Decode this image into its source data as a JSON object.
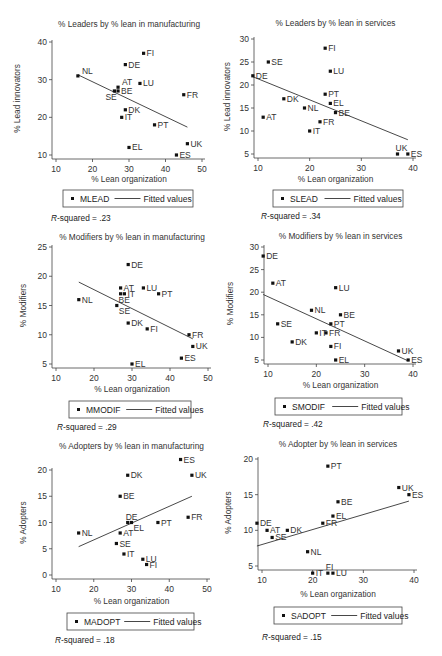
{
  "chart_data": [
    {
      "id": "mlead",
      "type": "scatter",
      "title": "% Leaders by % lean in manufacturing",
      "xlabel": "% Lean organization",
      "ylabel": "% Lead innovators",
      "xlim": [
        10,
        50
      ],
      "ylim": [
        10,
        40
      ],
      "xticks": [
        10,
        20,
        30,
        40,
        50
      ],
      "yticks": [
        10,
        20,
        30,
        40
      ],
      "grid": false,
      "legend": {
        "series": "MLEAD",
        "fit": "Fitted values",
        "position": "bottom"
      },
      "r_squared": ".23",
      "fit_line": [
        [
          16,
          31.3
        ],
        [
          46,
          17.4
        ]
      ],
      "points": [
        {
          "label": "FI",
          "x": 34,
          "y": 37,
          "pos": "r"
        },
        {
          "label": "DE",
          "x": 29,
          "y": 34,
          "pos": "r"
        },
        {
          "label": "NL",
          "x": 16,
          "y": 31,
          "pos": "tr"
        },
        {
          "label": "LU",
          "x": 33,
          "y": 29,
          "pos": "r"
        },
        {
          "label": "AT",
          "x": 27,
          "y": 28,
          "pos": "tr"
        },
        {
          "label": "BE",
          "x": 27,
          "y": 27,
          "pos": "r"
        },
        {
          "label": "SE",
          "x": 26,
          "y": 27,
          "pos": "bl"
        },
        {
          "label": "FR",
          "x": 45,
          "y": 26,
          "pos": "r"
        },
        {
          "label": "DK",
          "x": 29,
          "y": 22,
          "pos": "r"
        },
        {
          "label": "IT",
          "x": 28,
          "y": 20,
          "pos": "r"
        },
        {
          "label": "PT",
          "x": 37,
          "y": 18,
          "pos": "r"
        },
        {
          "label": "UK",
          "x": 46,
          "y": 13,
          "pos": "r"
        },
        {
          "label": "EL",
          "x": 30,
          "y": 12,
          "pos": "r"
        },
        {
          "label": "ES",
          "x": 43,
          "y": 10,
          "pos": "r"
        }
      ],
      "frame": {
        "x0": 56,
        "x1": 202,
        "y0": 155,
        "y1": 42,
        "titleY": 27,
        "legendY": 190,
        "legendX": 63,
        "legendW": 130,
        "rsqY": 221,
        "ylabX": 20,
        "xlabY": 182
      }
    },
    {
      "id": "slead",
      "type": "scatter",
      "title": "% Leaders by % lean in services",
      "xlabel": "% Lean organization",
      "ylabel": "% Lead innovators",
      "xlim": [
        10,
        40
      ],
      "ylim": [
        5,
        30
      ],
      "xticks": [
        10,
        20,
        30,
        40
      ],
      "yticks": [
        5,
        10,
        15,
        20,
        25,
        30
      ],
      "grid": false,
      "legend": {
        "series": "SLEAD",
        "fit": "Fitted values",
        "position": "bottom"
      },
      "r_squared": ".34",
      "fit_line": [
        [
          9,
          21.8
        ],
        [
          39,
          8.1
        ]
      ],
      "points": [
        {
          "label": "FI",
          "x": 23,
          "y": 28,
          "pos": "r"
        },
        {
          "label": "SE",
          "x": 12,
          "y": 25,
          "pos": "r"
        },
        {
          "label": "LU",
          "x": 24,
          "y": 23,
          "pos": "r"
        },
        {
          "label": "DE",
          "x": 9,
          "y": 22,
          "pos": "r"
        },
        {
          "label": "PT",
          "x": 23,
          "y": 18,
          "pos": "r"
        },
        {
          "label": "DK",
          "x": 15,
          "y": 17,
          "pos": "r"
        },
        {
          "label": "EL",
          "x": 24,
          "y": 16,
          "pos": "r"
        },
        {
          "label": "NL",
          "x": 19,
          "y": 15,
          "pos": "r"
        },
        {
          "label": "BE",
          "x": 25,
          "y": 14,
          "pos": "r"
        },
        {
          "label": "AT",
          "x": 11,
          "y": 13,
          "pos": "r"
        },
        {
          "label": "FR",
          "x": 22,
          "y": 12,
          "pos": "r"
        },
        {
          "label": "IT",
          "x": 20,
          "y": 10,
          "pos": "r"
        },
        {
          "label": "UK",
          "x": 37,
          "y": 5,
          "pos": "t"
        },
        {
          "label": "ES",
          "x": 39,
          "y": 5,
          "pos": "r"
        }
      ],
      "frame": {
        "x0": 258,
        "x1": 413,
        "y0": 154,
        "y1": 39,
        "titleY": 26,
        "legendY": 190,
        "legendX": 273,
        "legendW": 130,
        "rsqY": 219,
        "ylabX": 230,
        "xlabY": 182
      }
    },
    {
      "id": "mmodif",
      "type": "scatter",
      "title": "% Modifiers by % lean in manufacturing",
      "xlabel": "% Lean organization",
      "ylabel": "% Modifiers",
      "xlim": [
        10,
        50
      ],
      "ylim": [
        5,
        25
      ],
      "xticks": [
        10,
        20,
        30,
        40,
        50
      ],
      "yticks": [
        5,
        10,
        15,
        20,
        25
      ],
      "grid": false,
      "legend": {
        "series": "MMODIF",
        "fit": "Fitted values",
        "position": "bottom"
      },
      "r_squared": ".29",
      "fit_line": [
        [
          16,
          19
        ],
        [
          46,
          9.3
        ]
      ],
      "points": [
        {
          "label": "DE",
          "x": 29,
          "y": 22,
          "pos": "r"
        },
        {
          "label": "AT",
          "x": 27,
          "y": 18,
          "pos": "r"
        },
        {
          "label": "LU",
          "x": 33,
          "y": 18,
          "pos": "r"
        },
        {
          "label": "IT",
          "x": 28,
          "y": 17,
          "pos": "r"
        },
        {
          "label": "PT",
          "x": 37,
          "y": 17,
          "pos": "r"
        },
        {
          "label": "BE",
          "x": 27,
          "y": 17,
          "pos": "b"
        },
        {
          "label": "NL",
          "x": 16,
          "y": 16,
          "pos": "r"
        },
        {
          "label": "SE",
          "x": 26,
          "y": 15,
          "pos": "br"
        },
        {
          "label": "DK",
          "x": 29,
          "y": 12,
          "pos": "r"
        },
        {
          "label": "FI",
          "x": 34,
          "y": 11,
          "pos": "r"
        },
        {
          "label": "FR",
          "x": 45,
          "y": 10,
          "pos": "r"
        },
        {
          "label": "UK",
          "x": 46,
          "y": 8,
          "pos": "r"
        },
        {
          "label": "ES",
          "x": 43,
          "y": 6,
          "pos": "r"
        },
        {
          "label": "EL",
          "x": 30,
          "y": 5,
          "pos": "r"
        }
      ],
      "frame": {
        "x0": 56,
        "x1": 208,
        "y0": 364,
        "y1": 247,
        "titleY": 240,
        "legendY": 401,
        "legendX": 69,
        "legendW": 122,
        "rsqY": 430,
        "ylabX": 26,
        "xlabY": 392
      }
    },
    {
      "id": "smodif",
      "type": "scatter",
      "title": "% Modifiers by % lean in services",
      "xlabel": "% Lean organization",
      "ylabel": "% Modifiers",
      "xlim": [
        10,
        40
      ],
      "ylim": [
        5,
        30
      ],
      "xticks": [
        10,
        20,
        30,
        40
      ],
      "yticks": [
        5,
        10,
        15,
        20,
        25,
        30
      ],
      "grid": false,
      "legend": {
        "series": "SMODIF",
        "fit": "Fitted values",
        "position": "bottom"
      },
      "r_squared": ".42",
      "fit_line": [
        [
          9,
          19.5
        ],
        [
          39,
          4.8
        ]
      ],
      "points": [
        {
          "label": "DE",
          "x": 9,
          "y": 28,
          "pos": "r"
        },
        {
          "label": "AT",
          "x": 11,
          "y": 22,
          "pos": "r"
        },
        {
          "label": "LU",
          "x": 24,
          "y": 21,
          "pos": "r"
        },
        {
          "label": "NL",
          "x": 19,
          "y": 16,
          "pos": "r"
        },
        {
          "label": "BE",
          "x": 25,
          "y": 15,
          "pos": "r"
        },
        {
          "label": "SE",
          "x": 12,
          "y": 13,
          "pos": "r"
        },
        {
          "label": "PT",
          "x": 23,
          "y": 13,
          "pos": "r"
        },
        {
          "label": "IT",
          "x": 20,
          "y": 11,
          "pos": "r"
        },
        {
          "label": "FR",
          "x": 22,
          "y": 11,
          "pos": "r"
        },
        {
          "label": "DK",
          "x": 15,
          "y": 9,
          "pos": "r"
        },
        {
          "label": "FI",
          "x": 23,
          "y": 8,
          "pos": "r"
        },
        {
          "label": "UK",
          "x": 37,
          "y": 7,
          "pos": "r"
        },
        {
          "label": "ES",
          "x": 39,
          "y": 5,
          "pos": "r"
        },
        {
          "label": "EL",
          "x": 24,
          "y": 5,
          "pos": "r"
        }
      ],
      "frame": {
        "x0": 268,
        "x1": 413,
        "y0": 360,
        "y1": 247,
        "titleY": 239,
        "legendY": 398,
        "legendX": 275,
        "legendW": 127,
        "rsqY": 427,
        "ylabX": 233,
        "xlabY": 388
      }
    },
    {
      "id": "madopt",
      "type": "scatter",
      "title": "% Adopters by % lean in manufacturing",
      "xlabel": "% Lean organization",
      "ylabel": "% Adopters",
      "xlim": [
        10,
        50
      ],
      "ylim": [
        0,
        20
      ],
      "xticks": [
        10,
        20,
        30,
        40,
        50
      ],
      "yticks": [
        0,
        5,
        10,
        15,
        20
      ],
      "grid": false,
      "legend": {
        "series": "MADOPT",
        "fit": "Fitted values",
        "position": "bottom"
      },
      "r_squared": ".18",
      "fit_line": [
        [
          16,
          5.4
        ],
        [
          46,
          15
        ]
      ],
      "points": [
        {
          "label": "ES",
          "x": 43,
          "y": 22,
          "pos": "r"
        },
        {
          "label": "DK",
          "x": 29,
          "y": 19,
          "pos": "r"
        },
        {
          "label": "UK",
          "x": 46,
          "y": 19,
          "pos": "r"
        },
        {
          "label": "BE",
          "x": 27,
          "y": 15,
          "pos": "r"
        },
        {
          "label": "FR",
          "x": 45,
          "y": 11,
          "pos": "r"
        },
        {
          "label": "DE",
          "x": 29,
          "y": 10,
          "pos": "t"
        },
        {
          "label": "EL",
          "x": 30,
          "y": 10,
          "pos": "br"
        },
        {
          "label": "PT",
          "x": 37,
          "y": 10,
          "pos": "r"
        },
        {
          "label": "NL",
          "x": 16,
          "y": 8,
          "pos": "r"
        },
        {
          "label": "AT",
          "x": 27,
          "y": 8,
          "pos": "r"
        },
        {
          "label": "SE",
          "x": 26,
          "y": 6,
          "pos": "r"
        },
        {
          "label": "IT",
          "x": 28,
          "y": 4,
          "pos": "r"
        },
        {
          "label": "LU",
          "x": 33,
          "y": 3,
          "pos": "r"
        },
        {
          "label": "FI",
          "x": 34,
          "y": 2,
          "pos": "r"
        }
      ],
      "frame": {
        "x0": 56,
        "x1": 207,
        "y0": 575,
        "y1": 470,
        "titleY": 449,
        "legendY": 613,
        "legendX": 67,
        "legendW": 127,
        "rsqY": 643,
        "ylabX": 26,
        "xlabY": 604
      }
    },
    {
      "id": "sadopt",
      "type": "scatter",
      "title": "% Adopter by % lean in services",
      "xlabel": "% Lean organization",
      "ylabel": "% Adopters",
      "xlim": [
        10,
        40
      ],
      "ylim": [
        5,
        20
      ],
      "xticks": [
        10,
        20,
        30,
        40
      ],
      "yticks": [
        5,
        10,
        15,
        20
      ],
      "grid": false,
      "legend": {
        "series": "SADOPT",
        "fit": "Fitted values",
        "position": "bottom"
      },
      "r_squared": ".15",
      "fit_line": [
        [
          9,
          7.8
        ],
        [
          39,
          14.1
        ]
      ],
      "points": [
        {
          "label": "PT",
          "x": 23,
          "y": 19,
          "pos": "r"
        },
        {
          "label": "UK",
          "x": 37,
          "y": 16,
          "pos": "r"
        },
        {
          "label": "ES",
          "x": 39,
          "y": 15,
          "pos": "r"
        },
        {
          "label": "BE",
          "x": 25,
          "y": 14,
          "pos": "r"
        },
        {
          "label": "EL",
          "x": 24,
          "y": 12,
          "pos": "r"
        },
        {
          "label": "DE",
          "x": 9,
          "y": 11,
          "pos": "r"
        },
        {
          "label": "FR",
          "x": 22,
          "y": 11,
          "pos": "r"
        },
        {
          "label": "AT",
          "x": 11,
          "y": 10,
          "pos": "r"
        },
        {
          "label": "DK",
          "x": 15,
          "y": 10,
          "pos": "r"
        },
        {
          "label": "SE",
          "x": 12,
          "y": 9,
          "pos": "r"
        },
        {
          "label": "NL",
          "x": 19,
          "y": 7,
          "pos": "r"
        },
        {
          "label": "FI",
          "x": 23,
          "y": 4,
          "pos": "t"
        },
        {
          "label": "IT",
          "x": 20,
          "y": 4,
          "pos": "r"
        },
        {
          "label": "LU",
          "x": 24,
          "y": 4,
          "pos": "r"
        }
      ],
      "frame": {
        "x0": 262,
        "x1": 414,
        "y0": 566,
        "y1": 459,
        "titleY": 447,
        "legendY": 607,
        "legendX": 274,
        "legendW": 128,
        "rsqY": 640,
        "ylabX": 231,
        "xlabY": 597
      }
    }
  ],
  "labels": {
    "r_squared_prefix": "R",
    "r_squared_suffix": "-squared = "
  }
}
